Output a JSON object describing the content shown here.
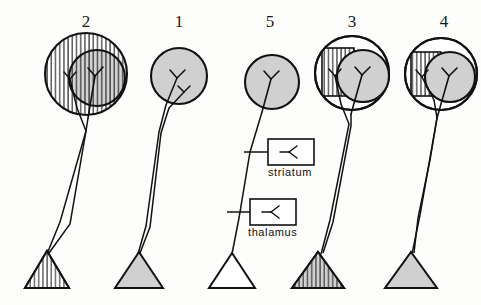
{
  "figure": {
    "name": "neuron-projection-schematic",
    "background": "#fdfdfc",
    "ink": "#111111",
    "gray_fill": "#d0d0d0",
    "width": 481,
    "height": 305
  },
  "columns": [
    {
      "id": "col-2",
      "label": "2",
      "label_x": 86,
      "label_y": 12,
      "circle_x": 86,
      "circle_y": 74,
      "soma_fill": "none"
    },
    {
      "id": "col-1",
      "label": "1",
      "label_x": 179,
      "label_y": 12,
      "circle_x": 179,
      "circle_y": 76,
      "soma_fill": "#d0d0d0"
    },
    {
      "id": "col-5",
      "label": "5",
      "label_x": 270,
      "label_y": 12,
      "circle_x": 272,
      "circle_y": 82,
      "soma_fill": "#d0d0d0"
    },
    {
      "id": "col-3",
      "label": "3",
      "label_x": 352,
      "label_y": 12,
      "circle_x": 352,
      "circle_y": 73,
      "soma_fill": "none"
    },
    {
      "id": "col-4",
      "label": "4",
      "label_x": 444,
      "label_y": 12,
      "circle_x": 441,
      "circle_y": 74,
      "soma_fill": "none"
    }
  ],
  "legend": {
    "striatum": {
      "label": "striatum",
      "box_x": 268,
      "box_y": 139,
      "box_w": 46,
      "box_h": 26,
      "label_x": 268,
      "label_y": 166
    },
    "thalamus": {
      "label": "thalamus",
      "box_x": 250,
      "box_y": 199,
      "box_w": 46,
      "box_h": 26,
      "label_x": 248,
      "label_y": 226
    }
  },
  "terminals": [
    {
      "id": "terminal-2",
      "fill": "none",
      "hatched": true
    },
    {
      "id": "terminal-1",
      "fill": "#d0d0d0",
      "hatched": false
    },
    {
      "id": "terminal-5",
      "fill": "none",
      "hatched": false
    },
    {
      "id": "terminal-3",
      "fill": "#d0d0d0",
      "hatched": true
    },
    {
      "id": "terminal-4",
      "fill": "#d0d0d0",
      "hatched": false
    }
  ]
}
